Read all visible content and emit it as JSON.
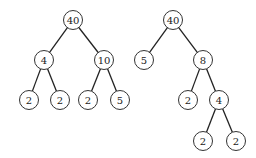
{
  "trees": [
    {
      "name": "left-tree",
      "nodes": [
        {
          "id": "L0",
          "label": "40",
          "x": 73,
          "y": 20
        },
        {
          "id": "L1",
          "label": "4",
          "x": 44,
          "y": 60
        },
        {
          "id": "L2",
          "label": "10",
          "x": 104,
          "y": 60
        },
        {
          "id": "L3",
          "label": "2",
          "x": 29,
          "y": 100
        },
        {
          "id": "L4",
          "label": "2",
          "x": 60,
          "y": 100
        },
        {
          "id": "L5",
          "label": "2",
          "x": 88,
          "y": 100
        },
        {
          "id": "L6",
          "label": "5",
          "x": 120,
          "y": 100
        }
      ],
      "edges": [
        [
          "L0",
          "L1"
        ],
        [
          "L0",
          "L2"
        ],
        [
          "L1",
          "L3"
        ],
        [
          "L1",
          "L4"
        ],
        [
          "L2",
          "L5"
        ],
        [
          "L2",
          "L6"
        ]
      ]
    },
    {
      "name": "right-tree",
      "nodes": [
        {
          "id": "R0",
          "label": "40",
          "x": 173,
          "y": 20
        },
        {
          "id": "R1",
          "label": "5",
          "x": 144,
          "y": 60
        },
        {
          "id": "R2",
          "label": "8",
          "x": 203,
          "y": 60
        },
        {
          "id": "R3",
          "label": "2",
          "x": 188,
          "y": 100
        },
        {
          "id": "R4",
          "label": "4",
          "x": 219,
          "y": 100
        },
        {
          "id": "R5",
          "label": "2",
          "x": 203,
          "y": 141
        },
        {
          "id": "R6",
          "label": "2",
          "x": 236,
          "y": 141
        }
      ],
      "edges": [
        [
          "R0",
          "R1"
        ],
        [
          "R0",
          "R2"
        ],
        [
          "R2",
          "R3"
        ],
        [
          "R2",
          "R4"
        ],
        [
          "R4",
          "R5"
        ],
        [
          "R4",
          "R6"
        ]
      ]
    }
  ],
  "style": {
    "node_radius": 9.5
  }
}
